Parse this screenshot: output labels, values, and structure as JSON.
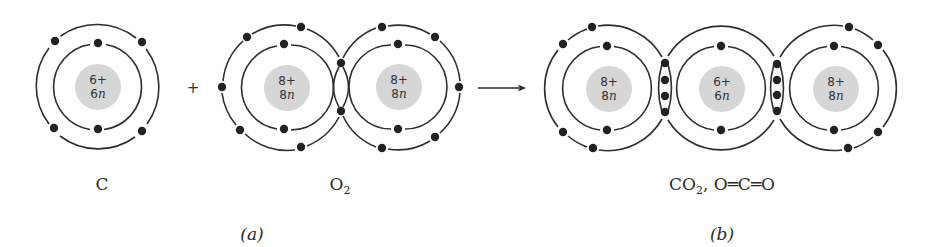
{
  "figure": {
    "panel_a": {
      "label": "(a)",
      "reactants": [
        {
          "name": "carbon-atom",
          "label": "C",
          "nucleus": {
            "charge": "6+",
            "neutrons_num": "6",
            "neutrons_unit": "n"
          }
        },
        {
          "name": "oxygen-molecule",
          "label_main": "O",
          "label_sub": "2",
          "atoms": [
            {
              "nucleus": {
                "charge": "8+",
                "neutrons_num": "8",
                "neutrons_unit": "n"
              }
            },
            {
              "nucleus": {
                "charge": "8+",
                "neutrons_num": "8",
                "neutrons_unit": "n"
              }
            }
          ]
        }
      ],
      "plus_sign": "+"
    },
    "arrow": "→",
    "panel_b": {
      "label": "(b)",
      "product": {
        "name": "carbon-dioxide-molecule",
        "label_prefix": "CO",
        "label_sub": "2",
        "label_suffix": ", O═C═O",
        "atoms": [
          {
            "element": "O",
            "nucleus": {
              "charge": "8+",
              "neutrons_num": "8",
              "neutrons_unit": "n"
            }
          },
          {
            "element": "C",
            "nucleus": {
              "charge": "6+",
              "neutrons_num": "6",
              "neutrons_unit": "n"
            }
          },
          {
            "element": "O",
            "nucleus": {
              "charge": "8+",
              "neutrons_num": "8",
              "neutrons_unit": "n"
            }
          }
        ]
      }
    },
    "colors": {
      "nucleus_fill": "#d6d6d6",
      "line": "#2e2e2e",
      "electron": "#222222",
      "background": "#ffffff"
    }
  }
}
